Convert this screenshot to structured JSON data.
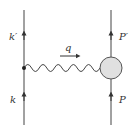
{
  "diagram": {
    "type": "feynman",
    "title": "",
    "lines": {
      "left_incoming": {
        "label": "k"
      },
      "left_outgoing": {
        "label": "k′"
      },
      "right_incoming": {
        "label": "P"
      },
      "right_outgoing": {
        "label": "P′"
      }
    },
    "propagator": {
      "kind": "photon-wavy",
      "label": "q"
    },
    "blob": {
      "fill": "#e0e0e0",
      "stroke": "#555555"
    },
    "line_color": "#444444"
  }
}
